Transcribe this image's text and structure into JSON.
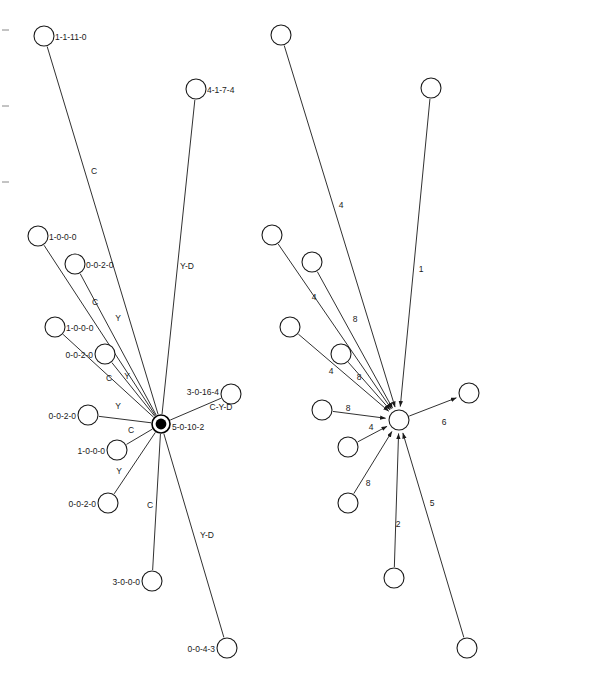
{
  "figure": {
    "title": "",
    "background_color": "#ffffff",
    "stroke_color": "#1a1a1a",
    "width": 609,
    "height": 684
  },
  "chart_data": {
    "type": "diagram",
    "subtype": "node-link-star-graph",
    "title": "",
    "panels": [
      {
        "id": "left-panel",
        "name": "labeled-star-network",
        "directed": false,
        "hub": {
          "id": "L-hub",
          "label": "5-0-10-2",
          "x": 161,
          "y": 424,
          "r": 9,
          "filled": true,
          "label_dx": 11,
          "label_dy": 6,
          "label_anchor": "start"
        },
        "nodes": [
          {
            "id": "L1",
            "label": "1-1-11-0",
            "x": 44,
            "y": 36,
            "r": 10,
            "label_dx": 11,
            "label_dy": 4,
            "label_anchor": "start"
          },
          {
            "id": "L2",
            "label": "4-1-7-4",
            "x": 196,
            "y": 89,
            "r": 10,
            "label_dx": 11,
            "label_dy": 4,
            "label_anchor": "start"
          },
          {
            "id": "L3",
            "label": "1-0-0-0",
            "x": 38,
            "y": 236,
            "r": 10,
            "label_dx": 11,
            "label_dy": 4,
            "label_anchor": "start"
          },
          {
            "id": "L4",
            "label": "0-0-2-0",
            "x": 75,
            "y": 264,
            "r": 10,
            "label_dx": 11,
            "label_dy": 4,
            "label_anchor": "start"
          },
          {
            "id": "L5",
            "label": "1-0-0-0",
            "x": 55,
            "y": 327,
            "r": 10,
            "label_dx": 11,
            "label_dy": 4,
            "label_anchor": "start"
          },
          {
            "id": "L6",
            "label": "0-0-2-0",
            "x": 105,
            "y": 354,
            "r": 10,
            "label_dx": -12,
            "label_dy": 4,
            "label_anchor": "end"
          },
          {
            "id": "L7",
            "label": "0-0-2-0",
            "x": 88,
            "y": 415,
            "r": 10,
            "label_dx": -12,
            "label_dy": 4,
            "label_anchor": "end"
          },
          {
            "id": "L8",
            "label": "1-0-0-0",
            "x": 117,
            "y": 450,
            "r": 10,
            "label_dx": -12,
            "label_dy": 4,
            "label_anchor": "end"
          },
          {
            "id": "L9",
            "label": "0-0-2-0",
            "x": 108,
            "y": 503,
            "r": 10,
            "label_dx": -12,
            "label_dy": 4,
            "label_anchor": "end"
          },
          {
            "id": "L10",
            "label": "3-0-0-0",
            "x": 152,
            "y": 581,
            "r": 10,
            "label_dx": -12,
            "label_dy": 4,
            "label_anchor": "end"
          },
          {
            "id": "L11",
            "label": "0-0-4-3",
            "x": 227,
            "y": 648,
            "r": 10,
            "label_dx": -12,
            "label_dy": 4,
            "label_anchor": "end"
          },
          {
            "id": "L12",
            "label": "3-0-16-4",
            "x": 231,
            "y": 394,
            "r": 10,
            "label_dx": -12,
            "label_dy": 1,
            "label_anchor": "end"
          }
        ],
        "edges": [
          {
            "from": "L1",
            "to": "L-hub",
            "label": "C",
            "lx": 94,
            "ly": 174
          },
          {
            "from": "L2",
            "to": "L-hub",
            "label": "Y-D",
            "lx": 187,
            "ly": 269
          },
          {
            "from": "L3",
            "to": "L-hub",
            "label": "C",
            "lx": 95,
            "ly": 305
          },
          {
            "from": "L4",
            "to": "L-hub",
            "label": "Y",
            "lx": 118,
            "ly": 321
          },
          {
            "from": "L5",
            "to": "L-hub",
            "label": "C",
            "lx": 109,
            "ly": 381
          },
          {
            "from": "L6",
            "to": "L-hub",
            "label": "Y",
            "lx": 127,
            "ly": 379
          },
          {
            "from": "L7",
            "to": "L-hub",
            "label": "Y",
            "lx": 118,
            "ly": 409
          },
          {
            "from": "L8",
            "to": "L-hub",
            "label": "C",
            "lx": 131,
            "ly": 433
          },
          {
            "from": "L9",
            "to": "L-hub",
            "label": "Y",
            "lx": 119,
            "ly": 474
          },
          {
            "from": "L10",
            "to": "L-hub",
            "label": "C",
            "lx": 150,
            "ly": 508
          },
          {
            "from": "L11",
            "to": "L-hub",
            "label": "Y-D",
            "lx": 207,
            "ly": 538
          },
          {
            "from": "L12",
            "to": "L-hub",
            "label": "C-Y-D",
            "lx": 221,
            "ly": 410
          }
        ]
      },
      {
        "id": "right-panel",
        "name": "weighted-directed-star-network",
        "directed": true,
        "hub": {
          "id": "R-hub",
          "label": "",
          "x": 399,
          "y": 420,
          "r": 10,
          "filled": false,
          "label_dx": 0,
          "label_dy": 0,
          "label_anchor": "start"
        },
        "nodes": [
          {
            "id": "R1",
            "label": "",
            "x": 281,
            "y": 35,
            "r": 10
          },
          {
            "id": "R2",
            "label": "",
            "x": 431,
            "y": 88,
            "r": 10
          },
          {
            "id": "R3",
            "label": "",
            "x": 272,
            "y": 235,
            "r": 10
          },
          {
            "id": "R4",
            "label": "",
            "x": 312,
            "y": 262,
            "r": 10
          },
          {
            "id": "R5",
            "label": "",
            "x": 290,
            "y": 327,
            "r": 10
          },
          {
            "id": "R6",
            "label": "",
            "x": 341,
            "y": 354,
            "r": 10
          },
          {
            "id": "R7",
            "label": "",
            "x": 322,
            "y": 410,
            "r": 10
          },
          {
            "id": "R8",
            "label": "",
            "x": 348,
            "y": 447,
            "r": 10
          },
          {
            "id": "R9",
            "label": "",
            "x": 348,
            "y": 503,
            "r": 10
          },
          {
            "id": "R10",
            "label": "",
            "x": 394,
            "y": 578,
            "r": 10
          },
          {
            "id": "R11",
            "label": "",
            "x": 467,
            "y": 648,
            "r": 10
          },
          {
            "id": "R12",
            "label": "",
            "x": 469,
            "y": 393,
            "r": 10
          }
        ],
        "edges": [
          {
            "from": "R1",
            "to": "R-hub",
            "label": "4",
            "lx": 341,
            "ly": 208,
            "arrow": true
          },
          {
            "from": "R2",
            "to": "R-hub",
            "label": "1",
            "lx": 421,
            "ly": 272,
            "arrow": true
          },
          {
            "from": "R3",
            "to": "R-hub",
            "label": "4",
            "lx": 314,
            "ly": 300,
            "arrow": true
          },
          {
            "from": "R4",
            "to": "R-hub",
            "label": "8",
            "lx": 355,
            "ly": 322,
            "arrow": true
          },
          {
            "from": "R5",
            "to": "R-hub",
            "label": "4",
            "lx": 331,
            "ly": 374,
            "arrow": true
          },
          {
            "from": "R6",
            "to": "R-hub",
            "label": "8",
            "lx": 359,
            "ly": 380,
            "arrow": true
          },
          {
            "from": "R7",
            "to": "R-hub",
            "label": "8",
            "lx": 348,
            "ly": 411,
            "arrow": true
          },
          {
            "from": "R8",
            "to": "R-hub",
            "label": "4",
            "lx": 371,
            "ly": 430,
            "arrow": true
          },
          {
            "from": "R9",
            "to": "R-hub",
            "label": "8",
            "lx": 368,
            "ly": 486,
            "arrow": true
          },
          {
            "from": "R10",
            "to": "R-hub",
            "label": "2",
            "lx": 398,
            "ly": 527,
            "arrow": true
          },
          {
            "from": "R11",
            "to": "R-hub",
            "label": "5",
            "lx": 432,
            "ly": 506,
            "arrow": true
          },
          {
            "from": "R-hub",
            "to": "R12",
            "label": "6",
            "lx": 444,
            "ly": 425,
            "arrow": true
          }
        ]
      }
    ],
    "left_margin_ticks": [
      {
        "x": 2,
        "y": 30
      },
      {
        "x": 2,
        "y": 106
      },
      {
        "x": 2,
        "y": 182
      }
    ]
  }
}
